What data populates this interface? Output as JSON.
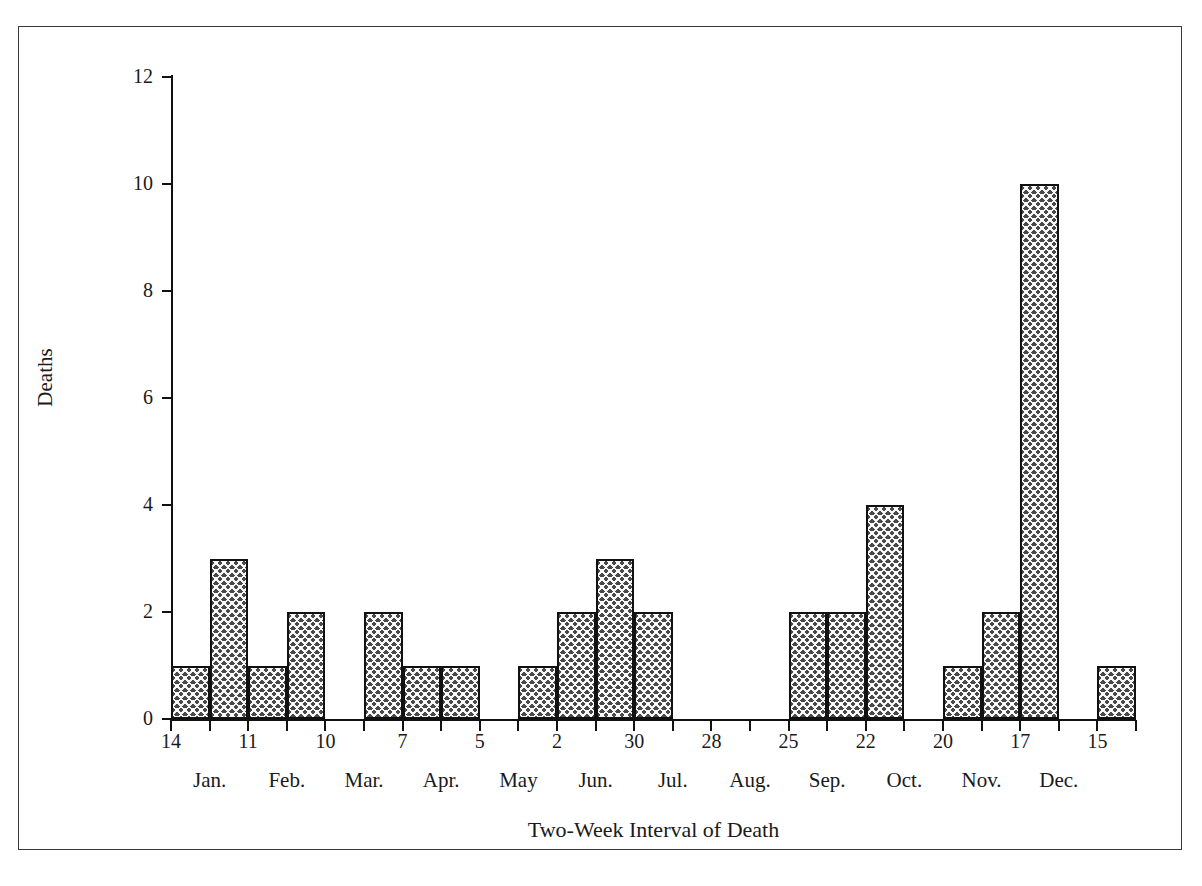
{
  "chart_data": {
    "type": "bar",
    "title": "",
    "xlabel": "Two-Week Interval of Death",
    "ylabel": "Deaths",
    "ylim": [
      0,
      12
    ],
    "y_ticks": [
      0,
      2,
      4,
      6,
      8,
      10,
      12
    ],
    "grid": false,
    "legend": null,
    "x_tick_labels": [
      "14",
      "11",
      "10",
      "7",
      "5",
      "2",
      "30",
      "28",
      "25",
      "22",
      "20",
      "17",
      "15"
    ],
    "month_labels": [
      "Jan.",
      "Feb.",
      "Mar.",
      "Apr.",
      "May",
      "Jun.",
      "Jul.",
      "Aug.",
      "Sep.",
      "Oct.",
      "Nov.",
      "Dec."
    ],
    "categories": [
      "Jan 14",
      "Jan 28",
      "Feb 11",
      "Feb 25",
      "Mar 10",
      "Mar 24",
      "Apr 7",
      "Apr 21",
      "May 5",
      "May 19",
      "Jun 2",
      "Jun 16",
      "Jun 30",
      "Jul 14",
      "Jul 28",
      "Aug 11",
      "Aug 25",
      "Sep 8",
      "Sep 22",
      "Oct 6",
      "Oct 20",
      "Nov 3",
      "Nov 17",
      "Dec 1",
      "Dec 15"
    ],
    "values": [
      1,
      3,
      1,
      2,
      0,
      2,
      1,
      1,
      0,
      1,
      2,
      3,
      2,
      0,
      0,
      0,
      2,
      2,
      4,
      0,
      1,
      2,
      10,
      0,
      1
    ],
    "bar_count": 25,
    "max_value": 10
  },
  "axis": {
    "y_title": "Deaths",
    "x_title": "Two-Week Interval of Death"
  },
  "colors": {
    "bar_fill": "#4a4a4a",
    "bar_edge": "#111111",
    "axis": "#111111",
    "frame": "#3a3a3a",
    "background": "#ffffff",
    "text": "#1a1a1a"
  }
}
